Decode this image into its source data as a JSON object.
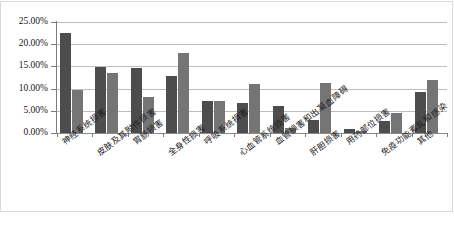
{
  "chart_data": {
    "type": "bar",
    "title": "",
    "subtitle": "",
    "xlabel": "",
    "ylabel": "",
    "ylim": [
      0,
      25
    ],
    "grid": true,
    "legend": "none",
    "y_tick_labels": [
      "0.00%",
      "5.00%",
      "10.00%",
      "15.00%",
      "20.00%",
      "25.00%"
    ],
    "y_tick_values": [
      0,
      5,
      10,
      15,
      20,
      25
    ],
    "categories": [
      "神经系统损害",
      "皮肤及其附件损害",
      "胃肠损害",
      "全身性损害",
      "呼吸系统损害",
      "心血管系统损害",
      "血管损害和出凝血障碍",
      "肝胆损害",
      "用药部位损害",
      "免疫功能紊乱和感染",
      "其他"
    ],
    "series": [
      {
        "name": "series-1",
        "color": "#4d4d4d",
        "values": [
          22.5,
          14.8,
          14.6,
          12.8,
          7.2,
          6.8,
          6.0,
          3.0,
          1.0,
          2.8,
          9.3
        ]
      },
      {
        "name": "series-2",
        "color": "#757575",
        "values": [
          9.8,
          13.5,
          8.0,
          18.1,
          7.3,
          11.0,
          1.2,
          11.3,
          0.5,
          4.5,
          12.0
        ]
      }
    ]
  },
  "colors": {
    "series_1": "#4d4d4d",
    "series_2": "#757575",
    "gridline": "#bdbdbd",
    "axis": "#7d7d7d",
    "frame": "#d9d9d9",
    "background": "#ffffff"
  }
}
